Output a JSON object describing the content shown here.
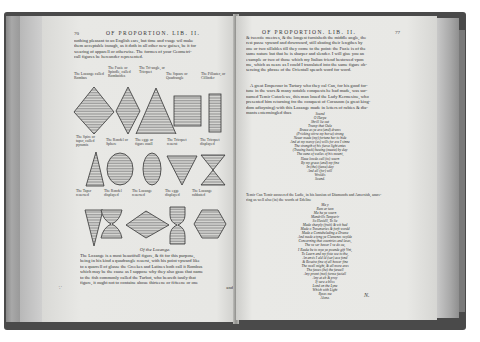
{
  "book": {
    "left_page": {
      "page_number": "70",
      "running_head": "OF PROPORTION. LIB. II.",
      "intro_lines": [
        "nothing pleasant to an English eare, but time and vsage wil make",
        "them acceptable inough, as it doth in all other new guises, be it for",
        "wearing of apparell or otherwise. The formes of your Geometri-",
        "call figures be hereunder represented."
      ],
      "figure_rows": [
        {
          "captions": [
            "The Lozange called Rombus",
            "The Fuzie or Spindle, called Romboides",
            "The Tri-angle, or Tricquet",
            "The Square or Quadrangle",
            "The Pillaster, or Cillinder"
          ],
          "shapes": [
            "lozange",
            "fuzie",
            "triangle",
            "square",
            "pillaster"
          ]
        },
        {
          "captions": [
            "The Spire or taper, called pyramis",
            "The Rondel or Sphere",
            "The egge or figure ouall",
            "The Tricquet reuerst",
            "The Tricquet displayed"
          ],
          "shapes": [
            "spire",
            "rondel",
            "egge",
            "tricquet-reversed",
            "tricquet-displayed"
          ]
        },
        {
          "captions": [
            "The Taper reuersed",
            "The Rondel displayed",
            "The Lozange reuersed",
            "The egge displayed",
            "The Lozange rabbated"
          ],
          "shapes": [
            "taper-reversed",
            "rondel-displayed",
            "lozange-reversed",
            "egge-displayed",
            "lozange-rabbated"
          ]
        }
      ],
      "section_title": "Of the Lozange.",
      "body_lines": [
        "The Lozange is a most beautifull figure, & fit for this purpose,",
        "being in his kind a quadrangle reuerst, with his point vpward like",
        "to a quarrell of glasse the Greekes and Latines both call it Rombus",
        "which may be the cause as I suppose why they also gaue that name",
        "to the fish commonly called the Turbot, who beareth iustly that",
        "figure, it ought not to containe aboue thirteene or fifteene or one",
        "and"
      ],
      "margin_mark": "∵"
    },
    "right_page": {
      "page_number": "77",
      "running_head": "OF PROPORTION. LIB. II.",
      "para1_lines": [
        "& twentie meetres, & the longest furnisheth the middle angle, the",
        "rest passe vpward and downward, still abating their lengthes by",
        "one or two sillables till they come to the point: the Fuzie is of the",
        "same nature but that he is sharper and slender. I will giue you an",
        "example or two of those which my Italian friend bestowed vpon",
        "me, which as neare as I could I translated into the same figure ob-",
        "seruing the phrase of the Orientall speach word for word."
      ],
      "para2_lines": [
        "A great Emperour in Tartary whō they cal Can, for his good for-",
        "tune in the wars & many notable conquests he had made, was sur-",
        "named Temir Cutzclewe, this man loued the Lady Kermesine, who",
        "presented him returning frō the conquest of Corasoon (a great king-",
        "dom adioyning) with this Lozange made in letters of rubies & dia-",
        "mants entermingled thus"
      ],
      "poem1": [
        "Sound",
        "O Harpe",
        "Shrill lie out",
        "Trump that Oule",
        "Braue as ye are (and) drums",
        "(Pricking stirre my horse) strong",
        "Neuer made (my) fortune her to hide",
        "And at my mercy (as) wills for ere I sinne",
        "The strength of his fierce light entes",
        "(Trauing back) hauing (meate) by day",
        "The oune of wailes of his mount,",
        "Haue lowde call (to) sourn",
        "By my grace (and) my fine",
        "In (the) (fame) day",
        "And all (for) will",
        "Wroldis",
        "Sound."
      ],
      "para3_lines": [
        "Temir Can Temir answered the Ladie, in his lausion of Diamonds and Amersish, ansre-",
        "ring as well also (in) the words of Edeline"
      ],
      "poem2": [
        "Ma y",
        "Rum ar tam",
        "Ma ha ye sourn",
        "Mandrills Temperir",
        "So Hasidll, To lie",
        "Made sharply (fruit) & wit had",
        "Made o Tresenaries & forft wordd",
        "Made a Contubeleding a Drume",
        "And made a tyng ye Clemenes swylde",
        "Concerning that countries and leses,",
        "The ve ser bewer I ve do ou,",
        "I Rauke be to mye ye pounde gift Vnt,",
        "To Learn and my fiste soe to the,",
        "An ansis I ald ld (sar) ace fond",
        "& Rosaire fine of all hower fine",
        "The swell might, & all more ares",
        "The fawes (be) the fareall",
        "Any promt (not) forme faciall",
        "Any at eb & proy",
        "If sure a bliss",
        "Lond on the Lyne",
        "Which with Light",
        "Ryzes me",
        "Alone."
      ],
      "margin_mark": "N."
    }
  },
  "colors": {
    "page": "#e7e7e4",
    "ink": "#2a2a2a",
    "binding": "#4a4a4a",
    "edge": "#a8a8a8"
  }
}
